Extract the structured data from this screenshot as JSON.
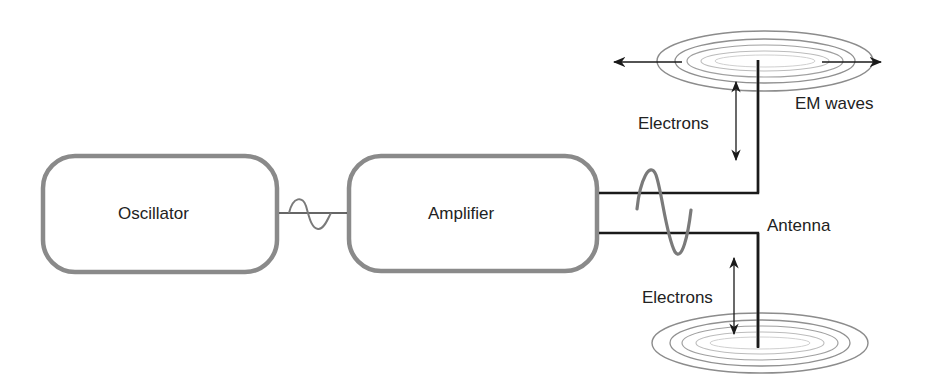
{
  "diagram": {
    "blocks": [
      {
        "id": "oscillator",
        "label": "Oscillator"
      },
      {
        "id": "amplifier",
        "label": "Amplifier"
      }
    ],
    "labels": {
      "antenna": "Antenna",
      "em_waves": "EM waves",
      "electrons_top": "Electrons",
      "electrons_bottom": "Electrons"
    },
    "connections": [
      {
        "from": "oscillator",
        "to": "amplifier",
        "signal": "small sine wave"
      },
      {
        "from": "amplifier",
        "to": "antenna",
        "signal": "amplified sine wave"
      }
    ],
    "colors": {
      "box_stroke": "#8a8a8a",
      "wire": "#1a1a1a",
      "wave": "#7a7a7a",
      "ellipse_outer": "#8c8c8c",
      "ellipse_inner": "#c8c8c8",
      "text": "#222222"
    }
  }
}
